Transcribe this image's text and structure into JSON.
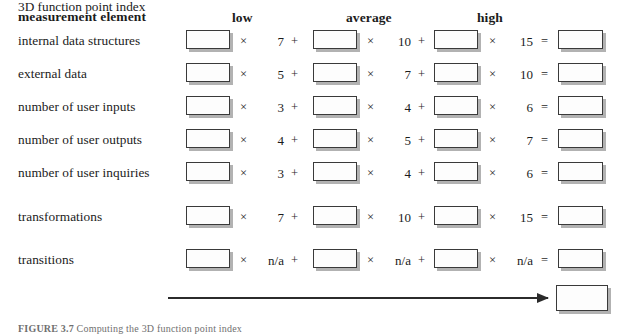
{
  "figure": {
    "caption_label": "FIGURE 3.7",
    "caption_text": "Computing the 3D function point index"
  },
  "table": {
    "columns": {
      "element_header": "measurement element",
      "low": "low",
      "average": "average",
      "high": "high"
    },
    "operators": {
      "times": "×",
      "plus": "+",
      "equals": "="
    },
    "rows": [
      {
        "label": "internal data structures",
        "low_weight": "7",
        "average_weight": "10",
        "high_weight": "15",
        "low_count": "",
        "average_count": "",
        "high_count": "",
        "result": ""
      },
      {
        "label": "external data",
        "low_weight": "5",
        "average_weight": "7",
        "high_weight": "10",
        "low_count": "",
        "average_count": "",
        "high_count": "",
        "result": ""
      },
      {
        "label": "number of user inputs",
        "low_weight": "3",
        "average_weight": "4",
        "high_weight": "6",
        "low_count": "",
        "average_count": "",
        "high_count": "",
        "result": ""
      },
      {
        "label": "number of user outputs",
        "low_weight": "4",
        "average_weight": "5",
        "high_weight": "7",
        "low_count": "",
        "average_count": "",
        "high_count": "",
        "result": ""
      },
      {
        "label": "number of user inquiries",
        "low_weight": "3",
        "average_weight": "4",
        "high_weight": "6",
        "low_count": "",
        "average_count": "",
        "high_count": "",
        "result": ""
      },
      {
        "label": "transformations",
        "low_weight": "7",
        "average_weight": "10",
        "high_weight": "15",
        "low_count": "",
        "average_count": "",
        "high_count": "",
        "result": ""
      },
      {
        "label": "transitions",
        "low_weight": "n/a",
        "average_weight": "n/a",
        "high_weight": "n/a",
        "low_count": "",
        "average_count": "",
        "high_count": "",
        "result": ""
      }
    ]
  },
  "total": {
    "label": "3D function point index",
    "value": ""
  },
  "colors": {
    "text": "#1b1b1b",
    "box_border": "#3a3a3a",
    "box_shadow": "#828282",
    "arrow": "#2b2b2b",
    "page_background": "#ffffff"
  }
}
